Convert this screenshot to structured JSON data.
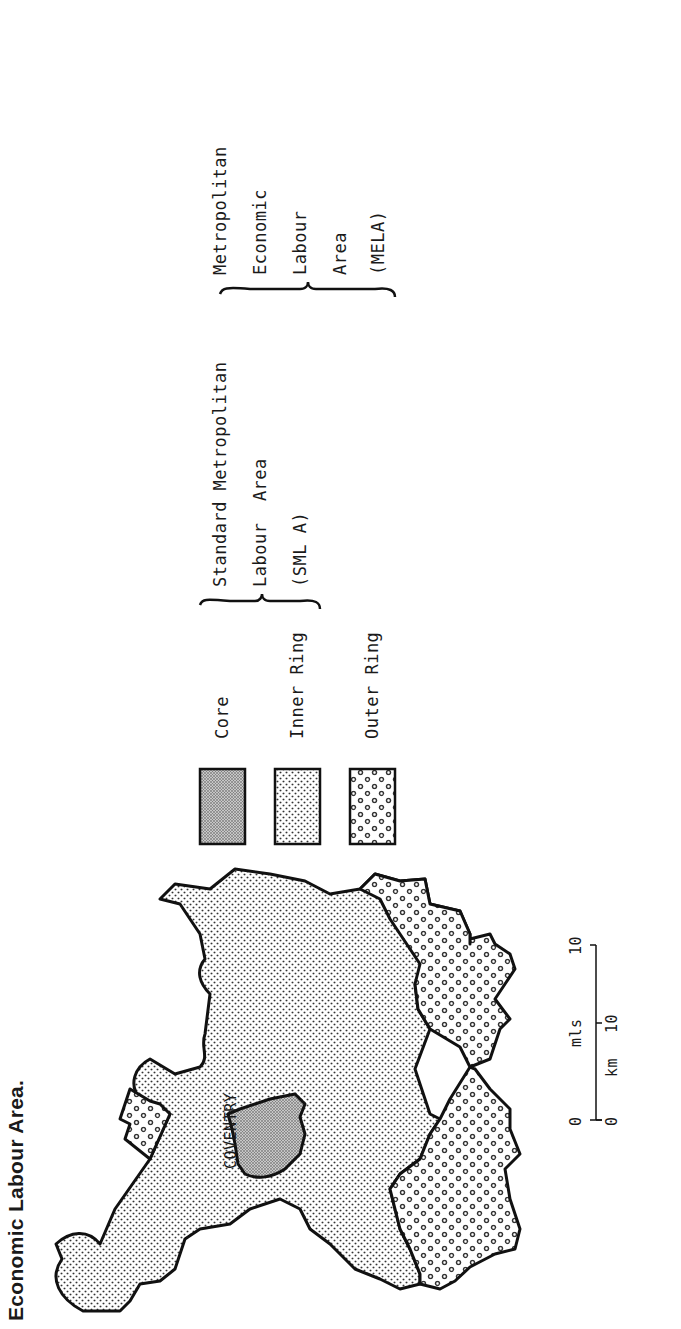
{
  "figure": {
    "title": "Economic Labour Area."
  },
  "map": {
    "place_label": "COVENTRY",
    "regions": [
      {
        "id": "core",
        "name": "Core",
        "pattern": "fine-dense-dot"
      },
      {
        "id": "inner_ring",
        "name": "Inner Ring",
        "pattern": "small-dot"
      },
      {
        "id": "outer_ring",
        "name": "Outer Ring",
        "pattern": "large-open-dot"
      }
    ],
    "scale_bar": {
      "miles_label": "mls",
      "km_label": "km",
      "miles_ticks": [
        "0",
        "10"
      ],
      "km_ticks": [
        "0",
        "10"
      ]
    }
  },
  "legend": {
    "items": [
      {
        "label": "Core"
      },
      {
        "label": "Inner Ring"
      },
      {
        "label": "Outer Ring"
      }
    ],
    "smla": {
      "lines": [
        "Standard Metropolitan",
        "Labour  Area",
        "(SML A)"
      ]
    },
    "mela": {
      "lines": [
        "Metropolitan",
        "Economic",
        "Labour",
        "Area",
        "(MELA)"
      ]
    }
  },
  "colors": {
    "ink": "#1a1a1a",
    "background": "#ffffff",
    "core_fill": "#9a9a9a"
  }
}
